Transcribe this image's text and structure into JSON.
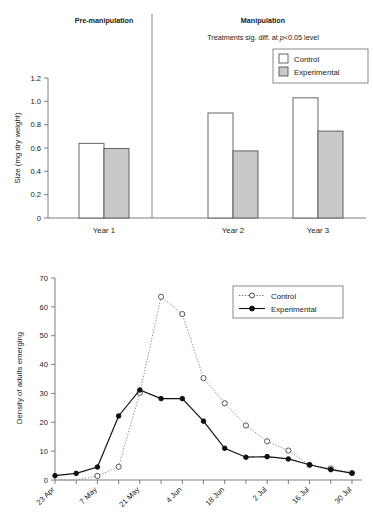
{
  "panel_a": {
    "header_left": "Pre-manipulation",
    "header_right": "Manipulation",
    "annotation_prefix": "Treatments sig. diff. at ",
    "annotation_italic": "p",
    "annotation_suffix": "<0.05 level",
    "legend": [
      {
        "label": "Control",
        "swatch": "#ffffff",
        "border": "#555555"
      },
      {
        "label": "Experimental",
        "swatch": "#c9c9c9",
        "border": "#555555"
      }
    ],
    "chart_data": {
      "type": "bar",
      "title": "",
      "xlabel": "",
      "ylabel": "Size (mg dry weight)",
      "categories": [
        "Year 1",
        "Year 2",
        "Year 3"
      ],
      "ylim": [
        0,
        1.2
      ],
      "yticks": [
        "0",
        "0.2",
        "0.4",
        "0.6",
        "0.8",
        "1.0",
        "1.2"
      ],
      "ytick_values": [
        0,
        0.2,
        0.4,
        0.6,
        0.8,
        1.0,
        1.2
      ],
      "grid": false,
      "legend_position": "top-right",
      "series": [
        {
          "name": "Control",
          "values": [
            0.64,
            0.9,
            1.03
          ]
        },
        {
          "name": "Experimental",
          "values": [
            0.595,
            0.575,
            0.745
          ]
        }
      ]
    }
  },
  "panel_b": {
    "legend": [
      {
        "label": "Control",
        "style": "dotted-open-circle"
      },
      {
        "label": "Experimental",
        "style": "solid-filled-circle"
      }
    ],
    "chart_data": {
      "type": "line",
      "title": "",
      "xlabel": "",
      "ylabel": "Density of adults emerging",
      "ylim": [
        0,
        70
      ],
      "yticks": [
        "0",
        "10",
        "20",
        "30",
        "40",
        "50",
        "60",
        "70"
      ],
      "ytick_values": [
        0,
        10,
        20,
        30,
        40,
        50,
        60,
        70
      ],
      "xticklabels": [
        "23 Apr",
        "7 May",
        "21 May",
        "4 Jun",
        "18 Jun",
        "2 Jul",
        "16 Jul",
        "30 Jul"
      ],
      "xtick_label_step": 2,
      "x": [
        0,
        1,
        2,
        3,
        4,
        5,
        6,
        7,
        8,
        9,
        10,
        11,
        12,
        13,
        14
      ],
      "x_all_labels": [
        "23 Apr",
        "30 Apr",
        "7 May",
        "14 May",
        "21 May",
        "28 May",
        "4 Jun",
        "11 Jun",
        "18 Jun",
        "25 Jun",
        "2 Jul",
        "9 Jul",
        "16 Jul",
        "23 Jul",
        "30 Jul"
      ],
      "grid": false,
      "legend_position": "top-right",
      "series": [
        {
          "name": "Control",
          "marker": "open-circle",
          "line": "dotted",
          "values": [
            0,
            0,
            1.4,
            4.6,
            30.2,
            63.5,
            57.5,
            35.3,
            26.6,
            18.9,
            13.4,
            10.2,
            5.2,
            4.0,
            2.4
          ]
        },
        {
          "name": "Experimental",
          "marker": "filled-circle",
          "line": "solid",
          "values": [
            1.5,
            2.3,
            4.5,
            22.2,
            31.2,
            28.2,
            28.2,
            20.4,
            11.0,
            7.9,
            8.1,
            7.3,
            5.3,
            3.6,
            2.4
          ]
        }
      ]
    }
  }
}
